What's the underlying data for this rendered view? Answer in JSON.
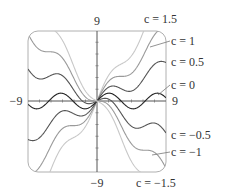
{
  "chart_data": {
    "type": "line",
    "title": "",
    "function": "y = c*x + sin(x)",
    "xlabel": "",
    "ylabel": "",
    "xlim": [
      -9,
      9
    ],
    "ylim": [
      -9,
      9
    ],
    "grid": false,
    "axis_tick_labels": {
      "x_left": "−9",
      "x_right": "9",
      "y_top": "9",
      "y_bottom": "−9"
    },
    "tick_spacing": 1.5,
    "series": [
      {
        "name": "c = 1.5",
        "c": 1.5,
        "label": "c = 1.5",
        "color": "#c8c8c8"
      },
      {
        "name": "c = 1",
        "c": 1,
        "label": "c = 1",
        "color": "#9a9a9a"
      },
      {
        "name": "c = 0.5",
        "c": 0.5,
        "label": "c = 0.5",
        "color": "#555555"
      },
      {
        "name": "c = 0",
        "c": 0,
        "label": "c = 0",
        "color": "#222222"
      },
      {
        "name": "c = −0.5",
        "c": -0.5,
        "label": "c = −0.5",
        "color": "#555555"
      },
      {
        "name": "c = −1",
        "c": -1,
        "label": "c = −1",
        "color": "#9a9a9a"
      },
      {
        "name": "c = −1.5",
        "c": -1.5,
        "label": "c = −1.5",
        "color": "#c8c8c8"
      }
    ],
    "legend_position": "right, inline labels with leader lines"
  }
}
